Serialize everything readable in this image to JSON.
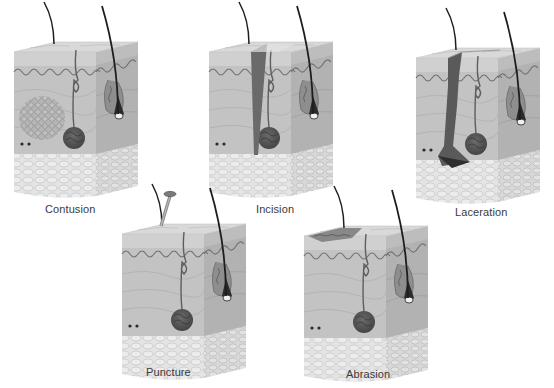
{
  "figure": {
    "title": "",
    "background": "#ffffff",
    "palette": {
      "epidermis_top": "#cfcfcf",
      "front_face": "#bdbdbd",
      "side_face": "#a9a9a9",
      "papillae_line": "#6f6f6f",
      "fat_base": "#e4e4e4",
      "fat_cell_outline": "#c6c6c6",
      "gland": "#595959",
      "hair": "#1e1e1e",
      "wound_dark": "#3c3c3c",
      "bruise": "#9a9a9a",
      "label_text": "#3a3a3a"
    }
  },
  "panels": [
    {
      "id": "contusion",
      "label": "Contusion",
      "x": 10,
      "y": 0,
      "label_x": 45,
      "label_y": 203,
      "wound": "bruise"
    },
    {
      "id": "incision",
      "label": "Incision",
      "x": 205,
      "y": 0,
      "label_x": 256,
      "label_y": 203,
      "wound": "cut"
    },
    {
      "id": "laceration",
      "label": "Laceration",
      "x": 412,
      "y": 6,
      "label_x": 455,
      "label_y": 206,
      "wound": "tear"
    },
    {
      "id": "puncture",
      "label": "Puncture",
      "x": 118,
      "y": 182,
      "label_x": 146,
      "label_y": 366,
      "wound": "nail"
    },
    {
      "id": "abrasion",
      "label": "Abrasion",
      "x": 300,
      "y": 184,
      "label_x": 346,
      "label_y": 368,
      "wound": "scrape"
    }
  ]
}
